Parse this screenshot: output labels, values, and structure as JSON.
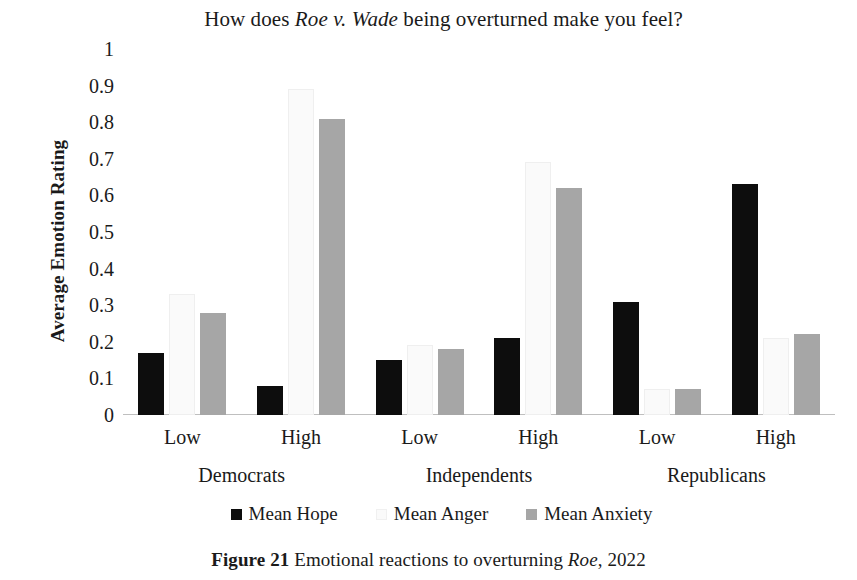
{
  "chart_data": {
    "type": "bar",
    "title": "How does Roe v. Wade being overturned make you feel?",
    "title_parts": {
      "before": "How does ",
      "italic": "Roe v. Wade",
      "after": " being overturned make you feel?"
    },
    "xlabel": "",
    "ylabel": "Average Emotion Rating",
    "ylim": [
      0,
      1
    ],
    "ytick_step": 0.1,
    "ytick_labels": [
      "1",
      "0.9",
      "0.8",
      "0.7",
      "0.6",
      "0.5",
      "0.4",
      "0.3",
      "0.2",
      "0.1",
      "0"
    ],
    "ytick_values": [
      1,
      0.9,
      0.8,
      0.7,
      0.6,
      0.5,
      0.4,
      0.3,
      0.2,
      0.1,
      0
    ],
    "grid": false,
    "legend_position": "bottom",
    "categories": [
      "Low",
      "High",
      "Low",
      "High",
      "Low",
      "High"
    ],
    "groups": [
      {
        "name": "Democrats",
        "levels": [
          {
            "label": "Low",
            "values": {
              "Mean Hope": 0.17,
              "Mean Anger": 0.33,
              "Mean Anxiety": 0.28
            }
          },
          {
            "label": "High",
            "values": {
              "Mean Hope": 0.08,
              "Mean Anger": 0.89,
              "Mean Anxiety": 0.81
            }
          }
        ]
      },
      {
        "name": "Independents",
        "levels": [
          {
            "label": "Low",
            "values": {
              "Mean Hope": 0.15,
              "Mean Anger": 0.19,
              "Mean Anxiety": 0.18
            }
          },
          {
            "label": "High",
            "values": {
              "Mean Hope": 0.21,
              "Mean Anger": 0.69,
              "Mean Anxiety": 0.62
            }
          }
        ]
      },
      {
        "name": "Republicans",
        "levels": [
          {
            "label": "Low",
            "values": {
              "Mean Hope": 0.31,
              "Mean Anger": 0.07,
              "Mean Anxiety": 0.07
            }
          },
          {
            "label": "High",
            "values": {
              "Mean Hope": 0.63,
              "Mean Anger": 0.21,
              "Mean Anxiety": 0.22
            }
          }
        ]
      }
    ],
    "series": [
      {
        "name": "Mean Hope",
        "color": "#0d0d0d",
        "values": [
          0.17,
          0.08,
          0.15,
          0.21,
          0.31,
          0.63
        ]
      },
      {
        "name": "Mean Anger",
        "color": "#fafafa",
        "values": [
          0.33,
          0.89,
          0.19,
          0.69,
          0.07,
          0.21
        ]
      },
      {
        "name": "Mean Anxiety",
        "color": "#a6a6a6",
        "values": [
          0.28,
          0.81,
          0.18,
          0.62,
          0.07,
          0.22
        ]
      }
    ]
  },
  "legend": {
    "items": [
      {
        "label": "Mean Hope",
        "swatch": "hope"
      },
      {
        "label": "Mean Anger",
        "swatch": "anger"
      },
      {
        "label": "Mean Anxiety",
        "swatch": "anxiety"
      }
    ]
  },
  "caption": {
    "figure_number": "Figure 21",
    "text_before": " Emotional reactions to overturning ",
    "italic": "Roe",
    "text_after": ", 2022"
  }
}
